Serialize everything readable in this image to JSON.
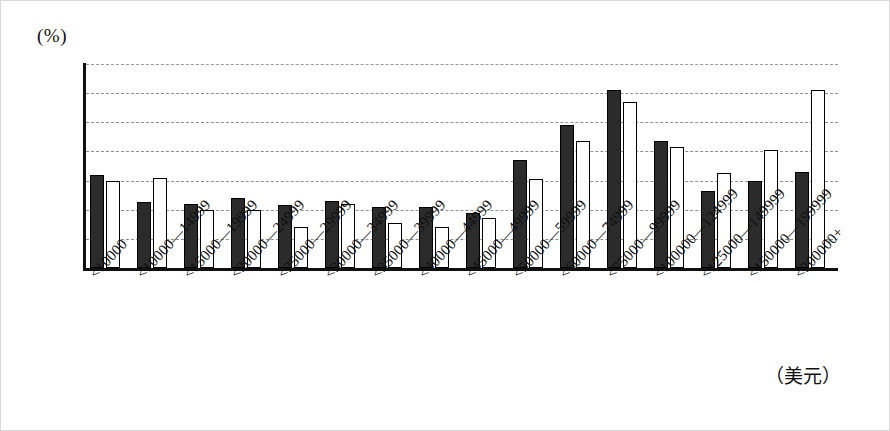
{
  "figure": {
    "unit_label": "(%)",
    "x_axis_unit": "（美元）"
  },
  "chart_data": {
    "type": "bar",
    "title": "",
    "xlabel": "（美元）",
    "ylabel": "(%)",
    "ylim": [
      0,
      14
    ],
    "yticks": [
      0,
      2,
      4,
      6,
      8,
      10,
      12,
      14
    ],
    "ytick_labels": [
      "0",
      "2",
      "4",
      "6",
      "8",
      "10",
      "12",
      "14"
    ],
    "grid": true,
    "legend": "none",
    "categories": [
      "<10000",
      "<10000—14999",
      "<15000—19999",
      "<20000—24999",
      "<25000—29999",
      "<30000—34999",
      "<35000—39999",
      "<40000—44999",
      "<45000—49999",
      "<50000—59999",
      "<60000—74999",
      "<75000—99999",
      "<100000—124999",
      "<125000—149999",
      "<150000—199999",
      "<200000+"
    ],
    "series": [
      {
        "name": "series-dark",
        "style": "filled-black",
        "values": [
          6.4,
          4.5,
          4.4,
          4.8,
          4.3,
          4.6,
          4.2,
          4.2,
          3.8,
          7.4,
          9.8,
          12.2,
          8.7,
          5.3,
          6.0,
          6.6
        ]
      },
      {
        "name": "series-light",
        "style": "hollow-white",
        "values": [
          6.0,
          6.2,
          4.0,
          4.0,
          2.8,
          4.4,
          3.1,
          2.8,
          3.4,
          6.1,
          8.7,
          11.4,
          8.3,
          6.5,
          8.1,
          12.2
        ]
      }
    ],
    "colors": {
      "dark_series": "#2b2b2b",
      "light_series": "#ffffff",
      "axis": "#111111",
      "gridline": "#8e8e8e"
    }
  }
}
